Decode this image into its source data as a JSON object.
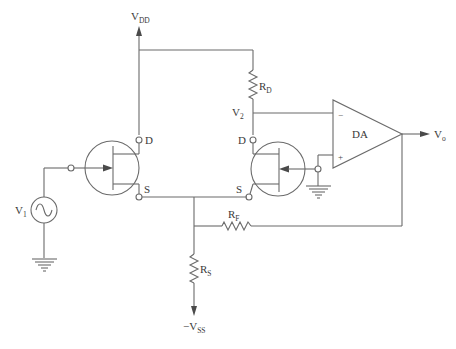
{
  "diagram": {
    "type": "circuit-schematic",
    "supplies": {
      "positive": {
        "main": "V",
        "sub": "DD"
      },
      "negative": {
        "main": "−V",
        "sub": "SS"
      }
    },
    "source": {
      "main": "V",
      "sub": "1"
    },
    "node_v2": {
      "main": "V",
      "sub": "2"
    },
    "resistors": {
      "drain": {
        "main": "R",
        "sub": "D"
      },
      "feedback": {
        "main": "R",
        "sub": "F"
      },
      "source": {
        "main": "R",
        "sub": "S"
      }
    },
    "transistor1": {
      "drain_label": "D",
      "source_label": "S"
    },
    "transistor2": {
      "drain_label": "D",
      "source_label": "S"
    },
    "amplifier": {
      "label": "DA",
      "inverting": "−",
      "non_inverting": "+"
    },
    "output": {
      "main": "V",
      "sub": "o"
    },
    "colors": {
      "line": "#6b6b6b",
      "text": "#3a3a3a",
      "background": "#ffffff"
    }
  }
}
